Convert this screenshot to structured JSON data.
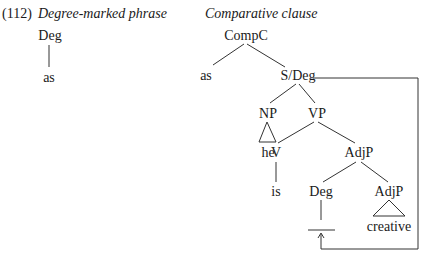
{
  "example_number": "(112)",
  "left_panel": {
    "caption": "Degree-marked phrase",
    "tree": {
      "root": "Deg",
      "leaf": "as"
    }
  },
  "right_panel": {
    "caption": "Comparative clause",
    "tree": {
      "root": "CompC",
      "comp": "as",
      "s_deg": "S/Deg",
      "np": "NP",
      "np_leaf": "he",
      "vp": "VP",
      "v": "V",
      "v_leaf": "is",
      "adjp": "AdjP",
      "deg": "Deg",
      "inner_adjp": "AdjP",
      "inner_adjp_leaf": "creative"
    },
    "movement_arrow": "S/Deg gap linked to Deg trace"
  }
}
